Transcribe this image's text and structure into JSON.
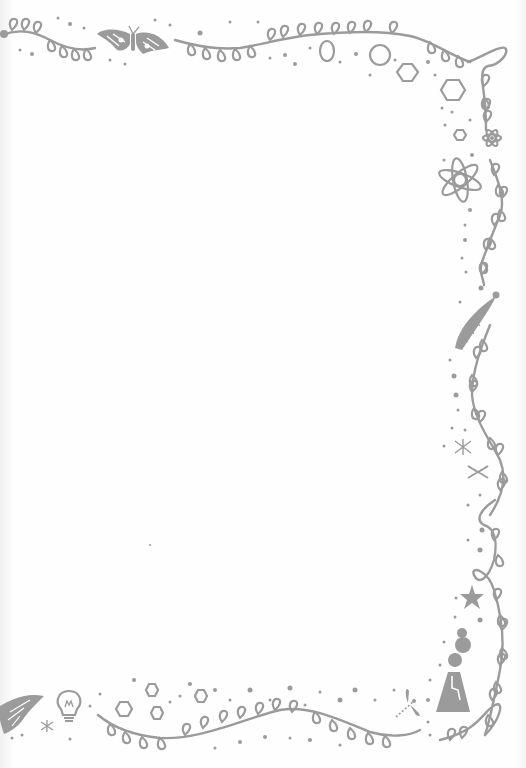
{
  "page": {
    "type": "decorative stationery border",
    "background_color": "#fefefe",
    "ink_color": "#9b9b9b"
  },
  "decorations": {
    "top": [
      "leafy-vine",
      "moth",
      "leafy-vine",
      "circle-outline",
      "hexagon-outline",
      "hexagon-outline",
      "loop-corner"
    ],
    "right": [
      "small-hexagon",
      "small-atom",
      "atom",
      "leafy-vine",
      "caterpillar",
      "leafy-vine",
      "firefly",
      "dna-squiggle",
      "leafy-vine",
      "starfish",
      "volcano-flask"
    ],
    "bottom": [
      "moth",
      "firefly",
      "lightbulb",
      "hexagon-outline",
      "hexagon-outline",
      "hexagon-outline",
      "leafy-vine",
      "dragonfly",
      "leafy-vine"
    ]
  },
  "writing_area": {
    "content": ""
  }
}
